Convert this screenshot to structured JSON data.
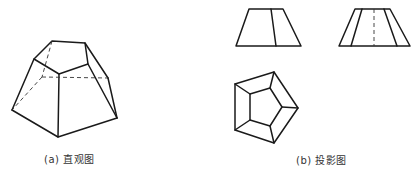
{
  "figure": {
    "pictorial": {
      "caption": "(a) 直观图",
      "top_face": [
        [
          52,
          41
        ],
        [
          85,
          43
        ],
        [
          88,
          64
        ],
        [
          59,
          74
        ],
        [
          34,
          59
        ]
      ],
      "bottom_visible": [
        [
          12,
          110
        ],
        [
          58,
          137
        ],
        [
          117,
          118
        ]
      ],
      "bottom_hidden": [
        [
          42,
          77
        ],
        [
          108,
          78
        ]
      ],
      "lateral_edges_visible": [
        [
          [
            34,
            59
          ],
          [
            12,
            110
          ]
        ],
        [
          [
            59,
            74
          ],
          [
            58,
            137
          ]
        ],
        [
          [
            88,
            64
          ],
          [
            117,
            118
          ]
        ],
        [
          [
            85,
            43
          ],
          [
            108,
            78
          ]
        ]
      ],
      "hidden_edges": [
        [
          [
            52,
            41
          ],
          [
            42,
            77
          ]
        ],
        [
          [
            42,
            77
          ],
          [
            108,
            78
          ]
        ],
        [
          [
            42,
            77
          ],
          [
            12,
            110
          ]
        ]
      ],
      "visible_edges_extra": [
        [
          [
            108,
            78
          ],
          [
            117,
            118
          ]
        ]
      ]
    },
    "projections": {
      "caption": "(b) 投影图",
      "front_view": {
        "outline": [
          [
            249,
            9
          ],
          [
            283,
            9
          ],
          [
            301,
            46
          ],
          [
            236,
            46
          ]
        ],
        "inner_lines": [
          [
            [
              271,
              9
            ],
            [
              276,
              46
            ]
          ]
        ]
      },
      "side_view": {
        "outline": [
          [
            355,
            9
          ],
          [
            390,
            9
          ],
          [
            410,
            46
          ],
          [
            339,
            46
          ]
        ],
        "inner_lines": [
          [
            [
              362,
              9
            ],
            [
              351,
              46
            ]
          ],
          [
            [
              384,
              9
            ],
            [
              397,
              46
            ]
          ]
        ],
        "hidden_lines": [
          [
            [
              374,
              9
            ],
            [
              374,
              46
            ]
          ]
        ]
      },
      "top_view": {
        "outer": [
          [
            235,
            84
          ],
          [
            274,
            72
          ],
          [
            298,
            108
          ],
          [
            274,
            143
          ],
          [
            235,
            130
          ]
        ],
        "inner": [
          [
            250,
            94
          ],
          [
            270,
            88
          ],
          [
            282,
            107
          ],
          [
            270,
            126
          ],
          [
            250,
            120
          ]
        ]
      }
    }
  }
}
